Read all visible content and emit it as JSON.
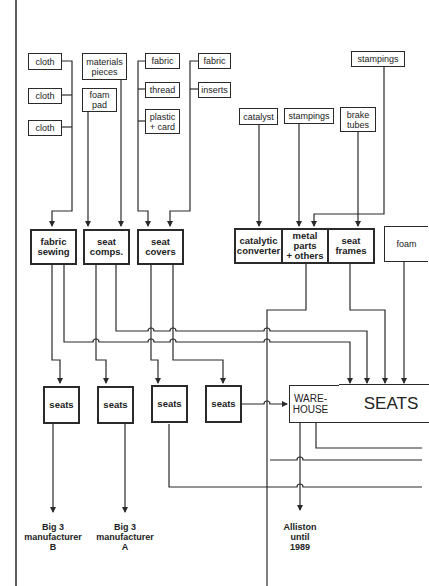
{
  "diagram": {
    "line_color": "#2a2a2a",
    "raw_inputs": [
      {
        "id": "cloth1",
        "label": "cloth"
      },
      {
        "id": "cloth2",
        "label": "cloth"
      },
      {
        "id": "cloth3",
        "label": "cloth"
      },
      {
        "id": "materials",
        "label": "materials\npieces"
      },
      {
        "id": "foampad",
        "label": "foam\npad"
      },
      {
        "id": "fabric1",
        "label": "fabric"
      },
      {
        "id": "thread",
        "label": "thread"
      },
      {
        "id": "plastic",
        "label": "plastic\n+ card"
      },
      {
        "id": "fabric2",
        "label": "fabric"
      },
      {
        "id": "inserts",
        "label": "inserts"
      },
      {
        "id": "catalyst",
        "label": "catalyst"
      },
      {
        "id": "stampings1",
        "label": "stampings"
      },
      {
        "id": "brake",
        "label": "brake\ntubes"
      },
      {
        "id": "stampings2",
        "label": "stampings"
      }
    ],
    "processes": [
      {
        "id": "fabricsewing",
        "label": "fabric\nsewing"
      },
      {
        "id": "seatcomps",
        "label": "seat\ncomps."
      },
      {
        "id": "seatcovers",
        "label": "seat\ncovers"
      },
      {
        "id": "catconv",
        "label": "catalytic\nconverter"
      },
      {
        "id": "metalparts",
        "label": "metal\nparts\n+ others"
      },
      {
        "id": "seatframes",
        "label": "seat\nframes"
      },
      {
        "id": "foam",
        "label": "foam"
      }
    ],
    "seat_plants": [
      {
        "id": "seats1",
        "label": "seats"
      },
      {
        "id": "seats2",
        "label": "seats"
      },
      {
        "id": "seats3",
        "label": "seats"
      },
      {
        "id": "seats4",
        "label": "seats"
      }
    ],
    "warehouse": {
      "label": "WARE-\nHOUSE"
    },
    "seats_main": {
      "label": "SEATS"
    },
    "destinations": [
      {
        "id": "big3b",
        "label": "Big 3\nmanufacturer\nB"
      },
      {
        "id": "big3a",
        "label": "Big 3\nmanufacturer\nA"
      },
      {
        "id": "alliston",
        "label": "Alliston\nuntil\n1989"
      }
    ]
  }
}
